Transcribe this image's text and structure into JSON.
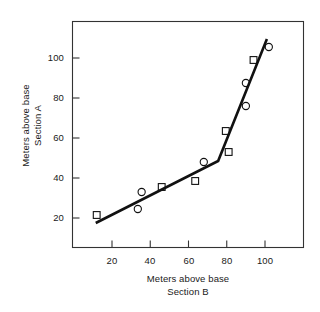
{
  "chart_data": {
    "type": "scatter",
    "title": "",
    "xlabel": "Meters above base",
    "xlabel_line2": "Section B",
    "ylabel": "Meters above base",
    "ylabel_line2": "Section A",
    "xlim": [
      5,
      115
    ],
    "ylim": [
      5,
      115
    ],
    "xticks": [
      20,
      40,
      60,
      80,
      100
    ],
    "ytick_labels": [
      "20",
      "40",
      "60",
      "80",
      "100"
    ],
    "xtick_labels": [
      "20",
      "40",
      "60",
      "80",
      "100"
    ],
    "yticks": [
      20,
      40,
      60,
      80,
      100
    ],
    "grid": false,
    "legend": "none",
    "series": [
      {
        "name": "square-markers",
        "marker": "square",
        "points": [
          {
            "x": 12,
            "y": 21.5
          },
          {
            "x": 46,
            "y": 35.5
          },
          {
            "x": 63.5,
            "y": 38.5
          },
          {
            "x": 79.5,
            "y": 63.5
          },
          {
            "x": 81,
            "y": 53.0
          },
          {
            "x": 94,
            "y": 99.0
          }
        ]
      },
      {
        "name": "circle-markers",
        "marker": "circle",
        "points": [
          {
            "x": 35.5,
            "y": 33.0
          },
          {
            "x": 33.5,
            "y": 24.5
          },
          {
            "x": 68,
            "y": 48.0
          },
          {
            "x": 90,
            "y": 87.5
          },
          {
            "x": 90,
            "y": 76.0
          },
          {
            "x": 102,
            "y": 105.5
          }
        ]
      }
    ],
    "fit_line": {
      "name": "two-segment-fit",
      "vertices": [
        {
          "x": 11.5,
          "y": 17.5
        },
        {
          "x": 75.5,
          "y": 48.5
        },
        {
          "x": 101,
          "y": 109.5
        }
      ]
    }
  },
  "axis": {
    "y_title_top": "Section A",
    "y_title_bottom": "Meters above base",
    "x_title_top": "Meters above base",
    "x_title_bottom": "Section B"
  }
}
